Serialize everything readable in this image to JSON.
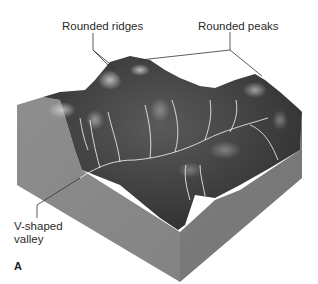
{
  "figure": {
    "panel_letter": "A",
    "labels": {
      "rounded_ridges": "Rounded ridges",
      "rounded_peaks": "Rounded peaks",
      "v_valley_line1": "V-shaped",
      "v_valley_line2": "valley"
    },
    "colors": {
      "background": "#ffffff",
      "block_left_face": "#8a8a8a",
      "block_right_face": "#7a7a7a",
      "terrain_dark": "#3a3a3a",
      "terrain_mid": "#5e5e5e",
      "terrain_highlight": "#bdbdbd",
      "streams": "#e8e8e8",
      "leader_lines": "#333333",
      "text": "#2b2b2b"
    }
  }
}
